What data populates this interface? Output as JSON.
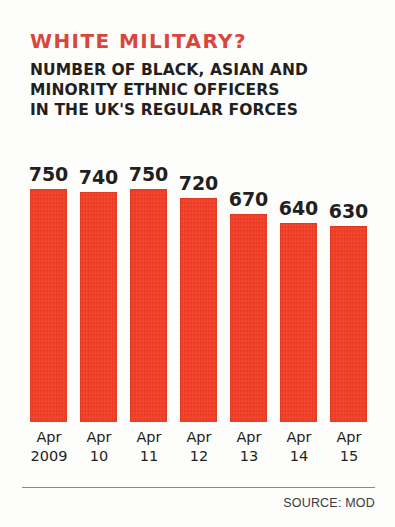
{
  "title": "WHITE MILITARY?",
  "subtitle_lines": [
    "NUMBER OF BLACK, ASIAN AND",
    "MINORITY ETHNIC OFFICERS",
    "IN THE UK'S REGULAR FORCES"
  ],
  "source": "SOURCE: MOD",
  "colors": {
    "title": "#d9463c",
    "bar": "#f43b22",
    "text": "#231f20",
    "rule": "#8a8a8a",
    "background": "#fdfdfb"
  },
  "chart_data": {
    "type": "bar",
    "title": "WHITE MILITARY?",
    "subtitle": "NUMBER OF BLACK, ASIAN AND MINORITY ETHNIC OFFICERS IN THE UK'S REGULAR FORCES",
    "xlabel": "",
    "ylabel": "",
    "ylim": [
      0,
      800
    ],
    "grid": false,
    "legend": false,
    "source": "SOURCE: MOD",
    "categories": [
      "Apr 2009",
      "Apr 10",
      "Apr 11",
      "Apr 12",
      "Apr 13",
      "Apr 14",
      "Apr 15"
    ],
    "tick_months": [
      "Apr",
      "Apr",
      "Apr",
      "Apr",
      "Apr",
      "Apr",
      "Apr"
    ],
    "tick_years": [
      "2009",
      "10",
      "11",
      "12",
      "13",
      "14",
      "15"
    ],
    "values": [
      750,
      740,
      750,
      720,
      670,
      640,
      630
    ],
    "value_labels": [
      "750",
      "740",
      "750",
      "720",
      "670",
      "640",
      "630"
    ]
  }
}
